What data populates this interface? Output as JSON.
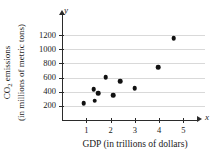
{
  "figure": {
    "axis_name_x": "x",
    "axis_name_y": "y",
    "background_color": "#ffffff",
    "point_color": "#111111",
    "grid_color": "#d9d9d9",
    "axis_color": "#2b2b2b"
  },
  "chart_data": {
    "type": "scatter",
    "title": "",
    "xlabel": "GDP (in trillions of dollars)",
    "ylabel_line1": "CO",
    "ylabel_sub": "2",
    "ylabel_line1_rest": " emissions",
    "ylabel_line2": "(in millions of metric tons)",
    "ylabel": "CO2 emissions (in millions of metric tons)",
    "xlim": [
      0,
      5.6
    ],
    "ylim": [
      0,
      1300
    ],
    "xticks": [
      1,
      2,
      3,
      4,
      5
    ],
    "xticklabels": [
      "1",
      "2",
      "3",
      "4",
      "5"
    ],
    "yticks": [
      200,
      400,
      600,
      800,
      1000,
      1200
    ],
    "yticklabels": [
      "200",
      "400",
      "600",
      "800",
      "1000",
      "1200"
    ],
    "grid": "horizontal",
    "legend": "none",
    "points": [
      {
        "x": 0.9,
        "y": 235
      },
      {
        "x": 1.3,
        "y": 435
      },
      {
        "x": 1.35,
        "y": 270
      },
      {
        "x": 1.5,
        "y": 375
      },
      {
        "x": 1.8,
        "y": 605
      },
      {
        "x": 2.1,
        "y": 350
      },
      {
        "x": 2.4,
        "y": 545
      },
      {
        "x": 3.0,
        "y": 450
      },
      {
        "x": 3.95,
        "y": 745
      },
      {
        "x": 4.6,
        "y": 1160
      }
    ]
  }
}
